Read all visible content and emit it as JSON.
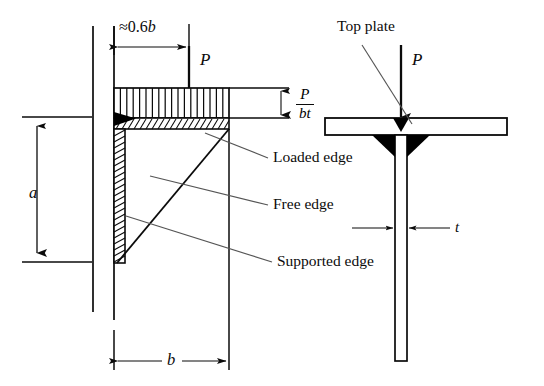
{
  "figure": {
    "background_color": "#ffffff",
    "line_color": "#0b0b0b",
    "weld_fill_color": "#000000",
    "leader_color": "#555555"
  },
  "left_view": {
    "name": "web-plate-elevation",
    "dimensions": {
      "top_span": {
        "label_prefix": "≈",
        "label_value": "0.6",
        "label_symbol": "b",
        "text": "≈ 0.6b"
      },
      "height": {
        "symbol": "a",
        "text": "a"
      },
      "width": {
        "symbol": "b",
        "text": "b"
      }
    },
    "load": {
      "symbol": "P",
      "text": "P",
      "direction": "down"
    },
    "stress_block": {
      "label_numerator": "P",
      "label_denominator": "bt",
      "tick_count": 18
    },
    "edges": [
      {
        "key": "loaded",
        "label": "Loaded edge"
      },
      {
        "key": "free",
        "label": "Free edge"
      },
      {
        "key": "supported",
        "label": "Supported edge"
      }
    ]
  },
  "right_view": {
    "name": "tee-section-end-view",
    "top_plate_label": "Top plate",
    "load": {
      "symbol": "P",
      "text": "P",
      "direction": "down"
    },
    "thickness": {
      "symbol": "t",
      "text": "t"
    },
    "welds": 2
  },
  "labels": {
    "approx_06b": "≈ 0.6b",
    "approx_sign": "≈",
    "zero_point_six": "0.6",
    "b_symbol": "b",
    "a_symbol": "a",
    "t_symbol": "t",
    "P_symbol": "P",
    "P_over_bt_num": "P",
    "P_over_bt_den": "bt",
    "loaded_edge": "Loaded edge",
    "free_edge": "Free edge",
    "supported_edge": "Supported edge",
    "top_plate": "Top plate"
  }
}
